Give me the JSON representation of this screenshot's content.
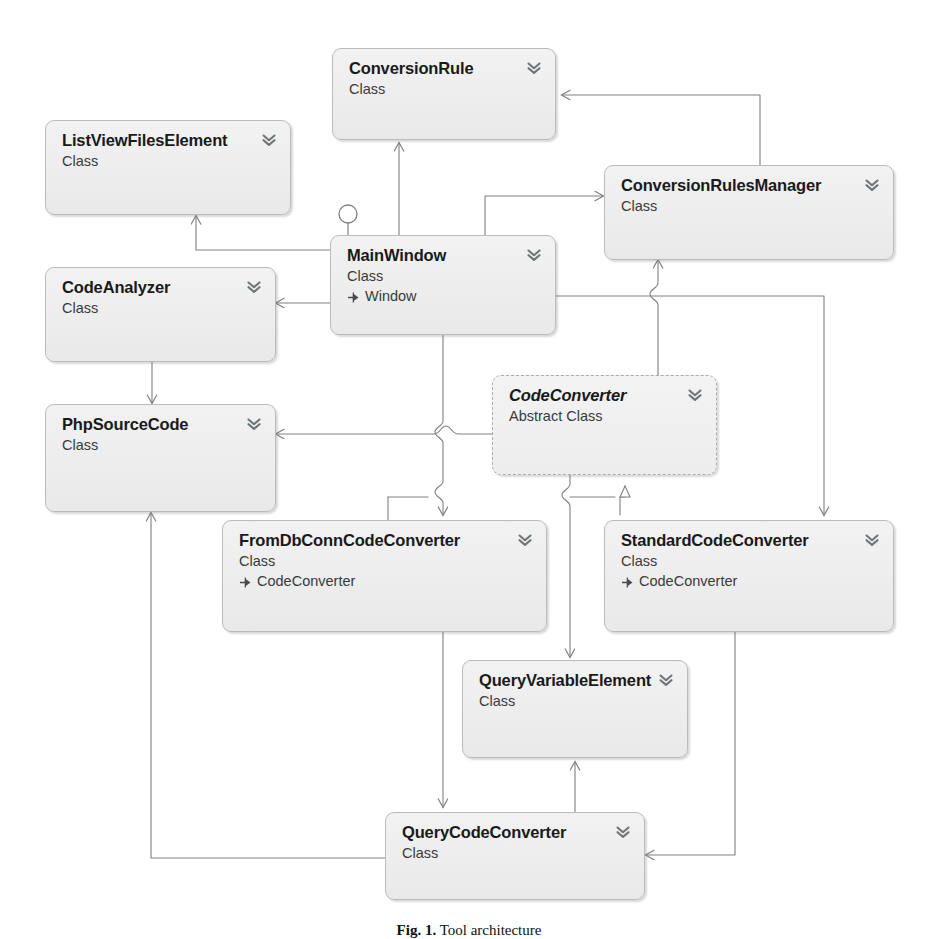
{
  "diagram": {
    "kind": "uml-class-diagram",
    "caption": "Fig. 1.  Tool architecture",
    "caption_label": "Fig. 1.",
    "caption_text": "Tool architecture",
    "colors": {
      "box_fill": "#efefef",
      "box_border": "#b9bcbe",
      "line": "#808080",
      "title_text": "#1a1a1a",
      "sub_text": "#3a3a3a",
      "chevron": "#6f7477"
    },
    "icons": {
      "collapse": "chevron-double-down-icon",
      "inherits": "arrow-right-stub-icon",
      "interface": "lollipop-interface-icon"
    },
    "classes": [
      {
        "id": "conversion-rule",
        "name": "ConversionRule",
        "stereotype": "Class",
        "abstract": false,
        "base": null
      },
      {
        "id": "list-view-files-element",
        "name": "ListViewFilesElement",
        "stereotype": "Class",
        "abstract": false,
        "base": null
      },
      {
        "id": "conversion-rules-manager",
        "name": "ConversionRulesManager",
        "stereotype": "Class",
        "abstract": false,
        "base": null
      },
      {
        "id": "main-window",
        "name": "MainWindow",
        "stereotype": "Class",
        "abstract": false,
        "base": "Window"
      },
      {
        "id": "code-analyzer",
        "name": "CodeAnalyzer",
        "stereotype": "Class",
        "abstract": false,
        "base": null
      },
      {
        "id": "code-converter",
        "name": "CodeConverter",
        "stereotype": "Abstract Class",
        "abstract": true,
        "base": null
      },
      {
        "id": "php-source-code",
        "name": "PhpSourceCode",
        "stereotype": "Class",
        "abstract": false,
        "base": null
      },
      {
        "id": "from-db-conn-code-converter",
        "name": "FromDbConnCodeConverter",
        "stereotype": "Class",
        "abstract": false,
        "base": "CodeConverter"
      },
      {
        "id": "standard-code-converter",
        "name": "StandardCodeConverter",
        "stereotype": "Class",
        "abstract": false,
        "base": "CodeConverter"
      },
      {
        "id": "query-variable-element",
        "name": "QueryVariableElement",
        "stereotype": "Class",
        "abstract": false,
        "base": null
      },
      {
        "id": "query-code-converter",
        "name": "QueryCodeConverter",
        "stereotype": "Class",
        "abstract": false,
        "base": null
      }
    ],
    "relations": [
      {
        "from": "main-window",
        "to": "conversion-rule",
        "type": "association"
      },
      {
        "from": "main-window",
        "to": "list-view-files-element",
        "type": "association"
      },
      {
        "from": "main-window",
        "to": "conversion-rules-manager",
        "type": "association"
      },
      {
        "from": "main-window",
        "to": "code-analyzer",
        "type": "association"
      },
      {
        "from": "main-window",
        "to": "from-db-conn-code-converter",
        "type": "association"
      },
      {
        "from": "main-window",
        "to": "standard-code-converter",
        "type": "association"
      },
      {
        "from": "code-analyzer",
        "to": "php-source-code",
        "type": "association"
      },
      {
        "from": "code-converter",
        "to": "php-source-code",
        "type": "association"
      },
      {
        "from": "code-converter",
        "to": "conversion-rules-manager",
        "type": "association"
      },
      {
        "from": "code-converter",
        "to": "query-variable-element",
        "type": "association"
      },
      {
        "from": "from-db-conn-code-converter",
        "to": "code-converter",
        "type": "generalization"
      },
      {
        "from": "standard-code-converter",
        "to": "code-converter",
        "type": "generalization"
      },
      {
        "from": "from-db-conn-code-converter",
        "to": "query-code-converter",
        "type": "association"
      },
      {
        "from": "standard-code-converter",
        "to": "query-code-converter",
        "type": "association"
      },
      {
        "from": "query-code-converter",
        "to": "query-variable-element",
        "type": "association"
      },
      {
        "from": "query-code-converter",
        "to": "php-source-code",
        "type": "association"
      },
      {
        "from": "conversion-rules-manager",
        "to": "conversion-rule",
        "type": "association"
      }
    ]
  }
}
